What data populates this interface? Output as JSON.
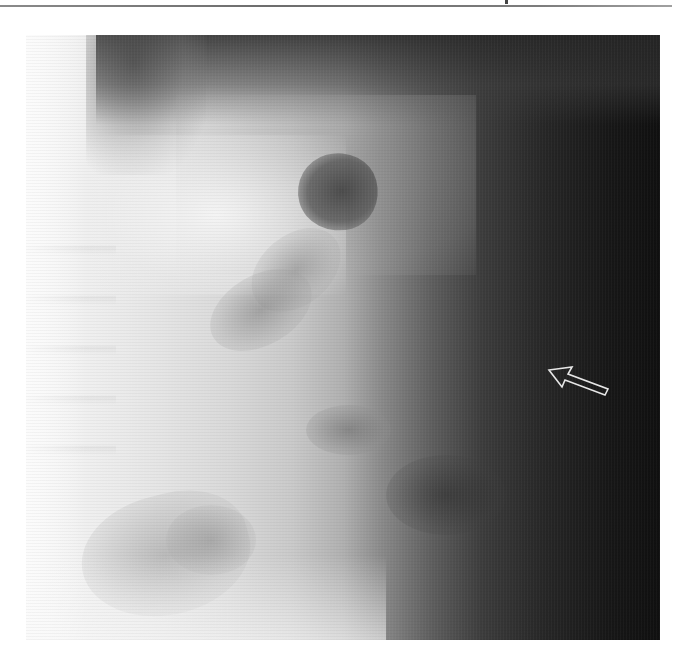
{
  "page": {
    "type": "scanned radiograph figure",
    "background_color": "#ffffff",
    "header_rule_color": "#7a7a7a"
  },
  "figure": {
    "tones": {
      "bright": "#f4f4f4",
      "mid": "#9a9a9a",
      "dark": "#121212"
    },
    "annotation": {
      "icon": "arrow-icon",
      "style": "hollow outline",
      "direction": "up-left",
      "stroke_color": "#e6e6e6"
    }
  }
}
